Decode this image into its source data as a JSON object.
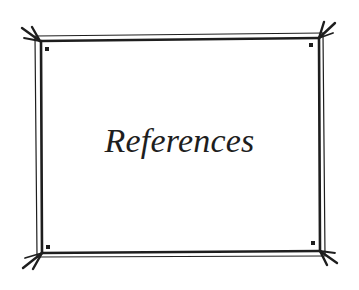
{
  "page": {
    "title": "References"
  },
  "style": {
    "ink_color": "#1e1e1e",
    "background": "#ffffff"
  },
  "frame": {
    "decoration": "double-line border with flared corner strokes and corner dots"
  }
}
